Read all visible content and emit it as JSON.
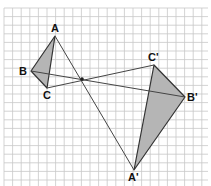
{
  "diagram": {
    "type": "dilation-with-negative-scale",
    "grid": {
      "x0": 4,
      "y0": 8,
      "x1": 208,
      "y1": 186,
      "spacing": 8.6,
      "line_color": "#c8c8c8",
      "minor_color": "#e4e4e4"
    },
    "center": {
      "x": 82,
      "y": 79
    },
    "original_triangle": {
      "vertices": [
        {
          "label": "A",
          "x": 55,
          "y": 36
        },
        {
          "label": "B",
          "x": 31,
          "y": 71
        },
        {
          "label": "C",
          "x": 47,
          "y": 88
        }
      ],
      "fill": "#b5b5b5",
      "stroke": "#333333"
    },
    "image_triangle": {
      "vertices": [
        {
          "label": "A'",
          "x": 134,
          "y": 170
        },
        {
          "label": "B'",
          "x": 185,
          "y": 97
        },
        {
          "label": "C'",
          "x": 154,
          "y": 65
        }
      ],
      "fill": "#b5b5b5",
      "stroke": "#333333"
    },
    "rays": [
      {
        "from": "A",
        "to": "A'"
      },
      {
        "from": "B",
        "to": "B'"
      },
      {
        "from": "C",
        "to": "C'"
      }
    ],
    "labels": {
      "A": "A",
      "B": "B",
      "C": "C",
      "A_prime": "A'",
      "B_prime": "B'",
      "C_prime": "C'"
    }
  }
}
